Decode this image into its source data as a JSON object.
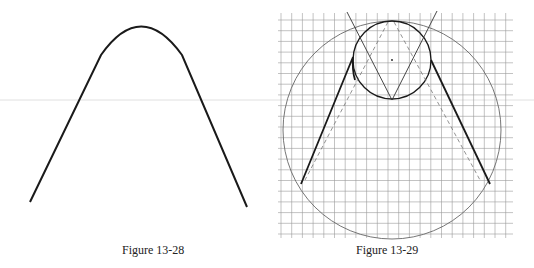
{
  "figures": [
    {
      "id": "left",
      "caption": "Figure 13-28",
      "description": "Bent bar shape: two straight legs joined by a circular arc at the top"
    },
    {
      "id": "right",
      "caption": "Figure 13-29",
      "description": "Construction on grid: small circle inscribed at top of large circle, V-lines through small circle bottom, dashed construction lines, solid tangent legs"
    }
  ],
  "colors": {
    "stroke": "#1a1a1a",
    "grid": "#9a9a9a",
    "thin": "#666666",
    "background": "#ffffff"
  }
}
